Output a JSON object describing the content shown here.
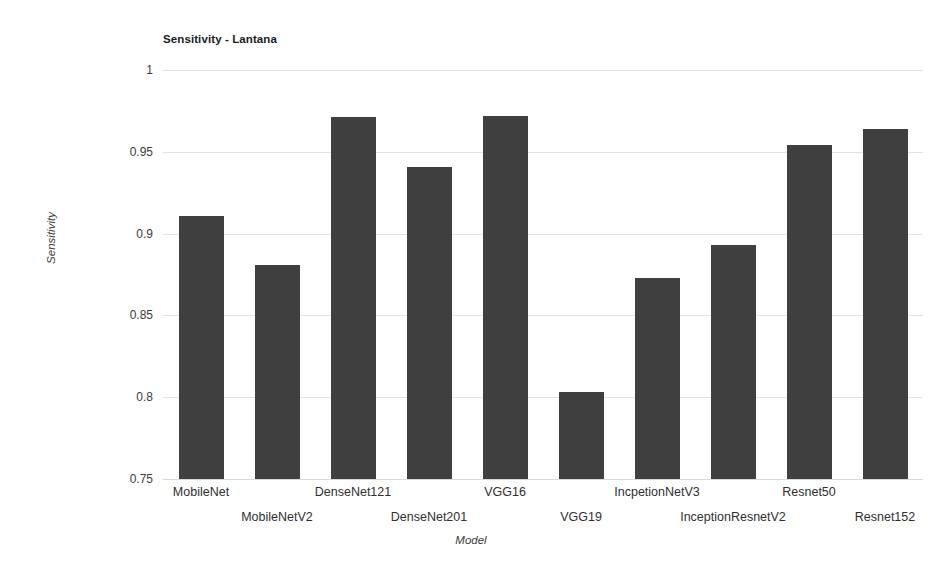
{
  "chart_data": {
    "type": "bar",
    "title": "Sensitivity - Lantana",
    "xlabel": "Model",
    "ylabel": "Sensitivity",
    "categories": [
      "MobileNet",
      "MobileNetV2",
      "DenseNet121",
      "DenseNet201",
      "VGG16",
      "VGG19",
      "IncpetionNetV3",
      "InceptionResnetV2",
      "Resnet50",
      "Resnet152"
    ],
    "values": [
      0.911,
      0.881,
      0.971,
      0.941,
      0.972,
      0.803,
      0.873,
      0.893,
      0.954,
      0.964
    ],
    "ylim": [
      0.75,
      1
    ],
    "yticks": [
      0.75,
      0.8,
      0.85,
      0.9,
      0.95,
      1
    ],
    "ytick_labels": [
      "0.75",
      "0.8",
      "0.85",
      "0.9",
      "0.95",
      "1"
    ],
    "grid": true,
    "legend": false,
    "bar_color": "#3f3f3f",
    "grid_color": "#e2e2e2",
    "background_color": "#ffffff"
  }
}
